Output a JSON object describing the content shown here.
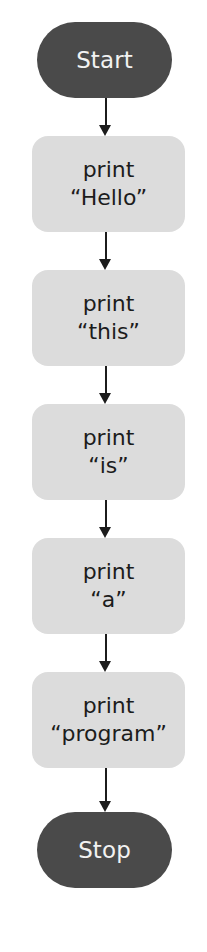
{
  "diagram": {
    "type": "flowchart",
    "title": "",
    "colors": {
      "terminator_fill": "#4a4a4a",
      "terminator_text": "#f2f2f2",
      "process_fill": "#dcdcdc",
      "process_text": "#1c1c1c",
      "connector": "#1c1c1c",
      "background": "#ffffff"
    },
    "nodes": [
      {
        "id": "start",
        "shape": "terminator",
        "label": "Start"
      },
      {
        "id": "p1",
        "shape": "process",
        "line1": "print",
        "line2": "“Hello”"
      },
      {
        "id": "p2",
        "shape": "process",
        "line1": "print",
        "line2": "“this”"
      },
      {
        "id": "p3",
        "shape": "process",
        "line1": "print",
        "line2": "“is”"
      },
      {
        "id": "p4",
        "shape": "process",
        "line1": "print",
        "line2": "“a”"
      },
      {
        "id": "p5",
        "shape": "process",
        "line1": "print",
        "line2": "“program”"
      },
      {
        "id": "stop",
        "shape": "terminator",
        "label": "Stop"
      }
    ],
    "edges": [
      {
        "from": "start",
        "to": "p1"
      },
      {
        "from": "p1",
        "to": "p2"
      },
      {
        "from": "p2",
        "to": "p3"
      },
      {
        "from": "p3",
        "to": "p4"
      },
      {
        "from": "p4",
        "to": "p5"
      },
      {
        "from": "p5",
        "to": "stop"
      }
    ]
  }
}
